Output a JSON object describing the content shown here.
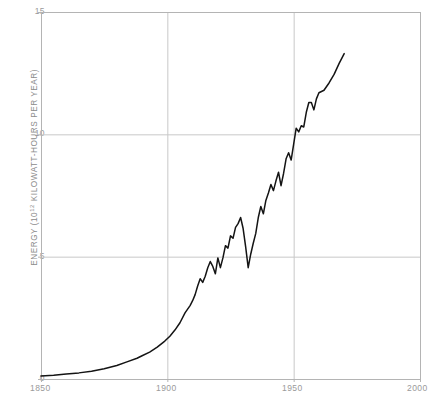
{
  "chart_data": {
    "type": "line",
    "title": "",
    "subtitle": "",
    "xlabel": "",
    "ylabel": "ENERGY (10¹² KILOWATT-HOURS PER YEAR)",
    "ylabel_prefix": "ENERGY (10",
    "ylabel_exponent": "12",
    "ylabel_suffix": " KILOWATT-HOURS PER YEAR)",
    "xlim": [
      1850,
      2000
    ],
    "ylim": [
      0,
      15
    ],
    "xticks": [
      "1850",
      "1900",
      "1950",
      "2000"
    ],
    "xtick_values": [
      1850,
      1900,
      1950,
      2000
    ],
    "yticks": [
      "0",
      "5",
      "10",
      "15"
    ],
    "ytick_values": [
      0,
      5,
      10,
      15
    ],
    "grid": true,
    "legend": "none",
    "line_color": "#141414",
    "grid_color": "#c8c8c8",
    "axis_color": "#b4b4b4",
    "tick_label_color": "#9a9a9a",
    "series": [
      {
        "name": "World energy consumption",
        "x": [
          1850,
          1855,
          1860,
          1865,
          1870,
          1875,
          1880,
          1884,
          1888,
          1890,
          1893,
          1896,
          1899,
          1901,
          1903,
          1905,
          1907,
          1909,
          1910,
          1911,
          1912,
          1913,
          1914,
          1915,
          1916,
          1917,
          1918,
          1919,
          1920,
          1921,
          1922,
          1923,
          1924,
          1925,
          1926,
          1927,
          1928,
          1929,
          1930,
          1931,
          1932,
          1933,
          1934,
          1935,
          1936,
          1937,
          1938,
          1939,
          1940,
          1941,
          1942,
          1943,
          1944,
          1945,
          1946,
          1947,
          1948,
          1949,
          1950,
          1951,
          1952,
          1953,
          1954,
          1955,
          1956,
          1957,
          1958,
          1959,
          1960,
          1962,
          1964,
          1966,
          1968,
          1970
        ],
        "y": [
          0.12,
          0.15,
          0.2,
          0.25,
          0.32,
          0.42,
          0.55,
          0.7,
          0.85,
          0.95,
          1.1,
          1.3,
          1.55,
          1.75,
          2.0,
          2.3,
          2.7,
          3.0,
          3.2,
          3.45,
          3.8,
          4.1,
          3.95,
          4.2,
          4.55,
          4.8,
          4.6,
          4.3,
          4.95,
          4.55,
          4.95,
          5.45,
          5.35,
          5.85,
          5.75,
          6.2,
          6.35,
          6.6,
          6.15,
          5.4,
          4.55,
          5.1,
          5.55,
          5.95,
          6.6,
          7.05,
          6.75,
          7.3,
          7.6,
          7.95,
          7.7,
          8.1,
          8.45,
          7.9,
          8.4,
          9.0,
          9.25,
          8.95,
          9.6,
          10.25,
          10.1,
          10.35,
          10.3,
          10.9,
          11.3,
          11.3,
          11.0,
          11.45,
          11.7,
          11.8,
          12.1,
          12.45,
          12.9,
          13.3
        ]
      }
    ]
  }
}
